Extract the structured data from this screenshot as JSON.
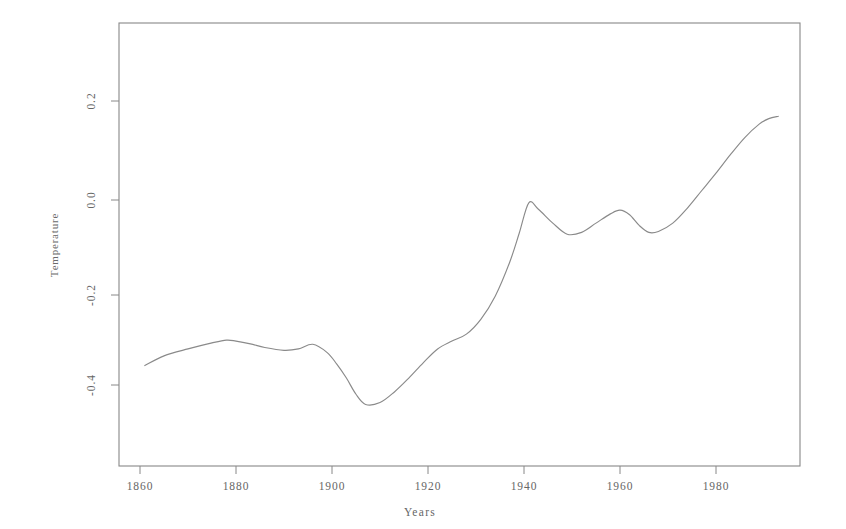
{
  "chart_data": {
    "type": "line",
    "title": "",
    "xlabel": "Years",
    "ylabel": "Temperature",
    "xlim": [
      1859,
      1996
    ],
    "ylim": [
      -0.52,
      0.28
    ],
    "grid": false,
    "legend": null,
    "xticks": [
      1860,
      1880,
      1900,
      1920,
      1940,
      1960,
      1980
    ],
    "xtick_labels": [
      "1860",
      "1880",
      "1900",
      "1920",
      "1940",
      "1960",
      "1980"
    ],
    "yticks": [
      0.2,
      0.0,
      -0.2,
      -0.4
    ],
    "ytick_labels": [
      "0.2",
      "0.0",
      "-0.2",
      "-0.4"
    ],
    "series": [
      {
        "name": "Temperature",
        "color": "#8a8a8a",
        "x": [
          1861,
          1865,
          1870,
          1875,
          1878,
          1880,
          1883,
          1886,
          1890,
          1893,
          1896,
          1899,
          1901,
          1903,
          1905,
          1907,
          1910,
          1913,
          1916,
          1919,
          1922,
          1925,
          1928,
          1931,
          1934,
          1937,
          1939,
          1941,
          1943,
          1946,
          1949,
          1952,
          1955,
          1958,
          1960,
          1962,
          1964,
          1966,
          1968,
          1971,
          1974,
          1977,
          1980,
          1983,
          1986,
          1989,
          1991,
          1993
        ],
        "y": [
          -0.358,
          -0.337,
          -0.322,
          -0.309,
          -0.303,
          -0.305,
          -0.311,
          -0.319,
          -0.325,
          -0.322,
          -0.312,
          -0.33,
          -0.355,
          -0.385,
          -0.42,
          -0.442,
          -0.438,
          -0.415,
          -0.385,
          -0.352,
          -0.322,
          -0.305,
          -0.29,
          -0.258,
          -0.208,
          -0.135,
          -0.072,
          -0.006,
          -0.02,
          -0.05,
          -0.074,
          -0.07,
          -0.05,
          -0.03,
          -0.022,
          -0.032,
          -0.055,
          -0.07,
          -0.068,
          -0.05,
          -0.018,
          0.02,
          0.058,
          0.098,
          0.135,
          0.164,
          0.176,
          0.181
        ]
      }
    ]
  },
  "axes": {
    "x_title": "Years",
    "y_title": "Temperature"
  }
}
